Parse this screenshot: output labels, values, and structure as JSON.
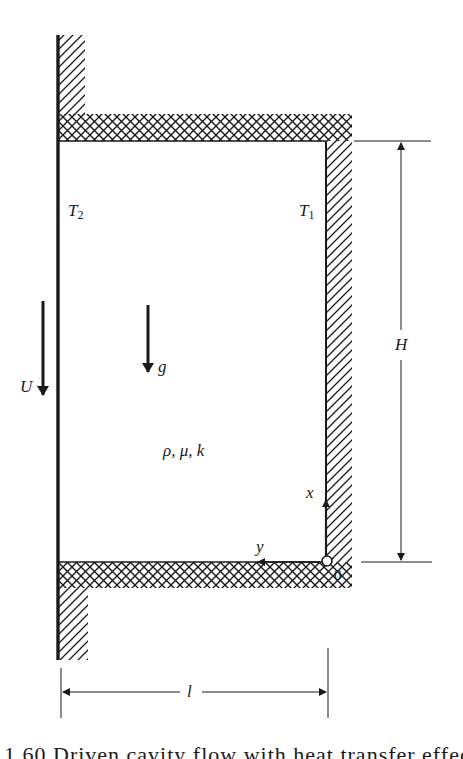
{
  "figure": {
    "type": "schematic",
    "colors": {
      "ink": "#1a1a1a",
      "background": "#ffffff"
    },
    "labels": {
      "left_wall_temp": "T",
      "left_wall_temp_sub": "2",
      "right_wall_temp": "T",
      "right_wall_temp_sub": "1",
      "wall_velocity": "U",
      "gravity": "g",
      "properties": "ρ, μ, k",
      "x_axis": "x",
      "y_axis": "y",
      "origin": "0",
      "height_dim": "H",
      "width_dim": "l"
    },
    "caption_partial": "1.60   Driven cavity flow with heat transfer effects"
  }
}
